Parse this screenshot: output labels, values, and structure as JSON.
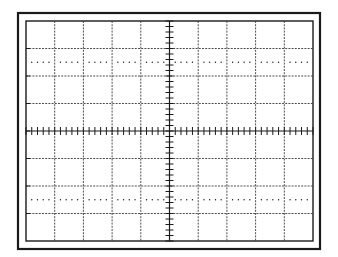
{
  "diagram": {
    "type": "oscilloscope-graticule",
    "divisions": {
      "horizontal": 10,
      "vertical": 8
    },
    "minor_ticks_per_division": 5,
    "dotted_reference_rows": [
      1.5,
      6.5
    ],
    "colors": {
      "background": "#ffffff",
      "line": "#1a1a1a",
      "grid": "#3a3a3a"
    },
    "frame": {
      "outer": {
        "x": 18,
        "y": 13,
        "w": 302,
        "h": 236
      },
      "inner": {
        "x": 26,
        "y": 21,
        "w": 287,
        "h": 220
      }
    }
  }
}
